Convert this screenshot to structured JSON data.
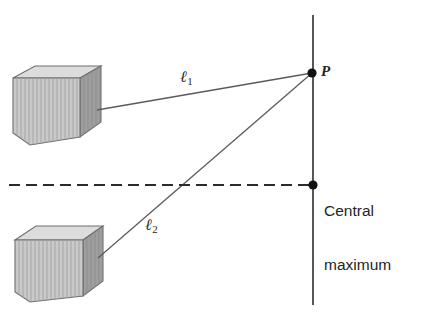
{
  "figure": {
    "background_color": "#ffffff",
    "width": 424,
    "height": 319
  },
  "labels": {
    "point_p": "P",
    "central_line1": "Central",
    "central_line2": "maximum",
    "path1_symbol": "ℓ",
    "path1_subscript": "1",
    "path2_symbol": "ℓ",
    "path2_subscript": "2"
  },
  "colors": {
    "line": "#5b5b5b",
    "screen_line": "#3a3a3a",
    "dashed_line": "#2b2b2b",
    "dot": "#111111",
    "text": "#252525",
    "box_front": "#c9c9c9",
    "box_top": "#d9d9d9",
    "box_side": "#9a9a9a",
    "box_stroke": "#6f6f6f",
    "grille_stripe": "#a8a8a8"
  },
  "geometry": {
    "point_p": {
      "x": 312,
      "y": 73
    },
    "central_maximum_point": {
      "x": 313,
      "y": 185
    },
    "screen_line": {
      "x": 313,
      "y_top": 15,
      "y_bottom": 305
    },
    "dashed_line": {
      "x_start": 9,
      "x_end": 313,
      "y": 185
    },
    "source1_anchor": {
      "x": 97,
      "y": 110
    },
    "source2_anchor": {
      "x": 98,
      "y": 258
    },
    "box_top_speaker": {
      "x": 13,
      "y": 68,
      "w": 88,
      "h": 77
    },
    "box_bottom_speaker": {
      "x": 15,
      "y": 224,
      "w": 88,
      "h": 78
    }
  },
  "elements": {
    "speaker_top_name": "upper sound source",
    "speaker_bottom_name": "lower sound source",
    "screen_name": "observation screen line",
    "dashed_name": "central axis"
  }
}
